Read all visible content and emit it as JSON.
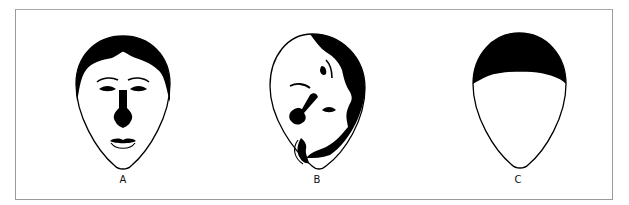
{
  "diagram": {
    "type": "face-illustration-panel",
    "figures": [
      {
        "id": "A",
        "label": "A",
        "description": "Upright face with hair, eyebrows, eyes, dark nose and lips"
      },
      {
        "id": "B",
        "label": "B",
        "description": "Scrambled face with displaced features and rotated hair"
      },
      {
        "id": "C",
        "label": "C",
        "description": "Blank face outline with hair cap only"
      }
    ],
    "colors": {
      "ink": "#000000",
      "background": "#ffffff",
      "frame": "#9a9a9a"
    }
  }
}
